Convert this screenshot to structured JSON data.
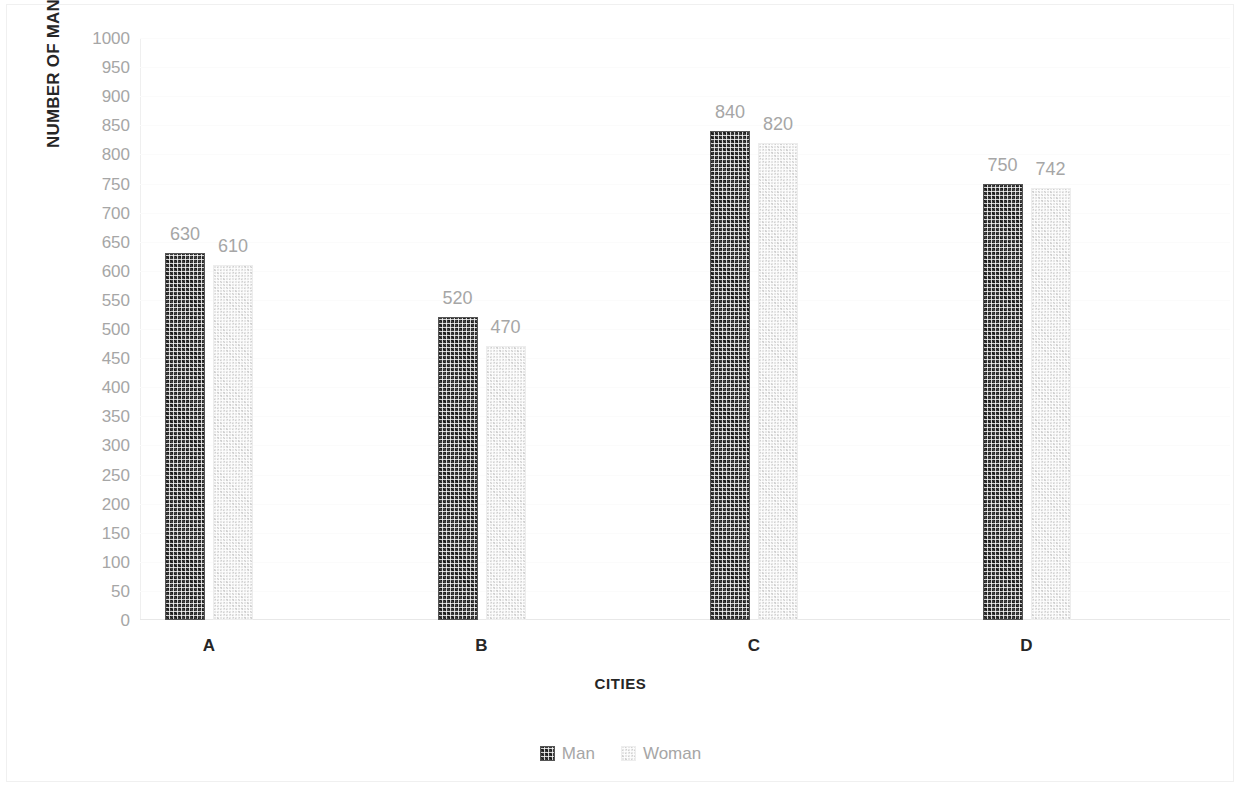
{
  "chart_data": {
    "type": "bar",
    "title": "",
    "subtitle": "",
    "xlabel": "CITIES",
    "ylabel": "NUMBER OF MAN AND WOMAN × 1000",
    "categories": [
      "A",
      "B",
      "C",
      "D"
    ],
    "series": [
      {
        "name": "Man",
        "values": [
          630,
          520,
          840,
          750
        ],
        "color": "#3b3b3b",
        "pattern": "checkerboard-dark"
      },
      {
        "name": "Woman",
        "values": [
          610,
          470,
          820,
          742
        ],
        "color": "#e6e6e6",
        "pattern": "checkerboard-light"
      }
    ],
    "ylim": [
      0,
      1000
    ],
    "ytick_step": 50,
    "yticks": [
      0,
      50,
      100,
      150,
      200,
      250,
      300,
      350,
      400,
      450,
      500,
      550,
      600,
      650,
      700,
      750,
      800,
      850,
      900,
      950,
      1000
    ],
    "ytick_labels": [
      "0",
      "50",
      "100",
      "150",
      "200",
      "250",
      "300",
      "350",
      "400",
      "450",
      "500",
      "550",
      "600",
      "650",
      "700",
      "750",
      "800",
      "850",
      "900",
      "950",
      "1000"
    ],
    "data_labels_shown": true,
    "grid": {
      "horizontal": true,
      "vertical": false,
      "color": "#fbfbfb"
    },
    "legend": {
      "position": "bottom",
      "entries": [
        "Man",
        "Woman"
      ]
    },
    "axis_label_color": "#a6a6a6",
    "axis_title_color": "#262626",
    "background": "#ffffff"
  },
  "legend": {
    "man_label": "Man",
    "woman_label": "Woman"
  },
  "axis": {
    "y_title": "NUMBER OF MAN AND WOMAN × 1000",
    "x_title": "CITIES"
  }
}
